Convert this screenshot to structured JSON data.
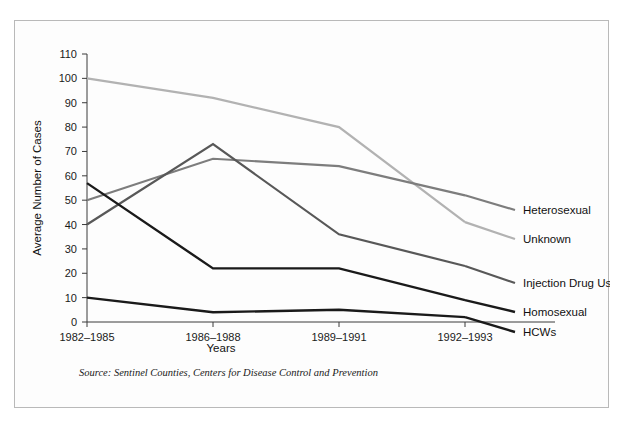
{
  "figure": {
    "source_note": "Source: Sentinel Counties, Centers for Disease Control and Prevention",
    "frame_color": "#b9b9b9",
    "background_color": "#fdfdfd"
  },
  "chart_data": {
    "type": "line",
    "title": "",
    "xlabel": "Years",
    "ylabel": "Average Number of Cases",
    "categories": [
      "1982–1985",
      "1986–1988",
      "1989–1991",
      "1992–1993"
    ],
    "ylim": [
      0,
      110
    ],
    "ytick_step": 10,
    "yticks": [
      0,
      10,
      20,
      30,
      40,
      50,
      60,
      70,
      80,
      90,
      100,
      110
    ],
    "ytick_labels": [
      "0",
      "10",
      "20",
      "30",
      "40",
      "50",
      "60",
      "70",
      "80",
      "90",
      "100",
      "110"
    ],
    "grid": false,
    "legend_position": "right-inline-labels",
    "series": [
      {
        "name": "Unknown",
        "values": [
          100,
          92,
          80,
          41
        ],
        "color": "#b2b2b2",
        "width": 2.2,
        "label_y": 222
      },
      {
        "name": "Heterosexual",
        "values": [
          50,
          67,
          64,
          52
        ],
        "color": "#7d7d7d",
        "width": 2.2,
        "label_y": 193
      },
      {
        "name": "Injection Drug Use",
        "values": [
          40,
          73,
          36,
          23
        ],
        "color": "#585858",
        "width": 2.2,
        "label_y": 266
      },
      {
        "name": "Homosexual",
        "values": [
          57,
          22,
          22,
          9
        ],
        "color": "#1a1a1a",
        "width": 2.4,
        "label_y": 295
      },
      {
        "name": "HCWs",
        "values": [
          10,
          4,
          5,
          2
        ],
        "color": "#1a1a1a",
        "width": 2.4,
        "label_y": 315
      }
    ]
  }
}
